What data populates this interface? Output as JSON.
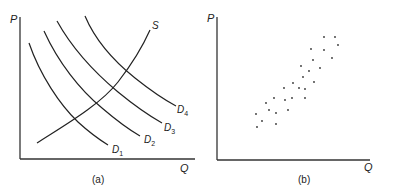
{
  "panel_a": {
    "caption": "(a)",
    "y_label": "P",
    "x_label": "Q",
    "supply": {
      "label": "S",
      "points": [
        [
          37,
          143
        ],
        [
          60,
          128
        ],
        [
          85,
          112
        ],
        [
          110,
          90
        ],
        [
          130,
          66
        ],
        [
          150,
          30
        ]
      ]
    },
    "demand": [
      {
        "label": "D",
        "sub": "1",
        "points": [
          [
            29,
            43
          ],
          [
            40,
            70
          ],
          [
            58,
            100
          ],
          [
            80,
            124
          ],
          [
            108,
            145
          ]
        ]
      },
      {
        "label": "D",
        "sub": "2",
        "points": [
          [
            44,
            31
          ],
          [
            58,
            60
          ],
          [
            80,
            88
          ],
          [
            108,
            113
          ],
          [
            140,
            136
          ]
        ]
      },
      {
        "label": "D",
        "sub": "3",
        "points": [
          [
            57,
            21
          ],
          [
            72,
            45
          ],
          [
            95,
            70
          ],
          [
            125,
            97
          ],
          [
            162,
            123
          ]
        ]
      },
      {
        "label": "D",
        "sub": "4",
        "points": [
          [
            85,
            16
          ],
          [
            98,
            43
          ],
          [
            122,
            70
          ],
          [
            148,
            90
          ],
          [
            176,
            106
          ]
        ]
      }
    ]
  },
  "panel_b": {
    "caption": "(b)",
    "y_label": "P",
    "x_label": "Q",
    "points": [
      [
        324,
        37
      ],
      [
        335,
        37
      ],
      [
        338,
        45
      ],
      [
        311,
        49
      ],
      [
        324,
        50
      ],
      [
        313,
        60
      ],
      [
        332,
        58
      ],
      [
        301,
        66
      ],
      [
        309,
        71
      ],
      [
        320,
        68
      ],
      [
        303,
        77
      ],
      [
        314,
        82
      ],
      [
        293,
        83
      ],
      [
        284,
        88
      ],
      [
        299,
        88
      ],
      [
        305,
        89
      ],
      [
        274,
        98
      ],
      [
        292,
        98
      ],
      [
        305,
        98
      ],
      [
        266,
        103
      ],
      [
        285,
        100
      ],
      [
        269,
        110
      ],
      [
        288,
        110
      ],
      [
        276,
        113
      ],
      [
        256,
        114
      ],
      [
        262,
        121
      ],
      [
        276,
        124
      ],
      [
        257,
        127
      ]
    ]
  },
  "chart_data": [
    {
      "type": "line",
      "title": "(a)",
      "xlabel": "Q",
      "ylabel": "P",
      "series": [
        {
          "name": "S",
          "shape": "upward-sloping supply curve"
        },
        {
          "name": "D1",
          "shape": "downward-sloping demand curve"
        },
        {
          "name": "D2",
          "shape": "downward-sloping demand curve"
        },
        {
          "name": "D3",
          "shape": "downward-sloping demand curve"
        },
        {
          "name": "D4",
          "shape": "downward-sloping demand curve"
        }
      ],
      "grid": false
    },
    {
      "type": "scatter",
      "title": "(b)",
      "xlabel": "Q",
      "ylabel": "P",
      "note": "28 equilibrium points showing positive P–Q relationship",
      "grid": false
    }
  ]
}
